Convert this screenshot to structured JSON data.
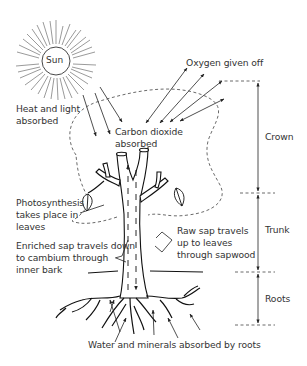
{
  "diagram": {
    "sun_label": "Sun",
    "labels": {
      "heat_light": "Heat and light\nabsorbed",
      "oxygen": "Oxygen given off",
      "carbon_dioxide": "Carbon dioxide\nabsorbed",
      "photosynthesis": "Photosynthesis\ntakes place in\nleaves",
      "enriched_sap": "Enriched sap travels down\nto cambium through\ninner bark",
      "raw_sap": "Raw sap travels\nup to leaves\nthrough sapwood",
      "water_minerals": "Water and minerals absorbed by roots"
    },
    "sections": [
      {
        "name": "Crown",
        "top": 81,
        "bottom": 193
      },
      {
        "name": "Trunk",
        "top": 193,
        "bottom": 272
      },
      {
        "name": "Roots",
        "top": 272,
        "bottom": 325
      }
    ],
    "colors": {
      "line": "#222222",
      "text": "#333333",
      "background": "#ffffff"
    }
  }
}
